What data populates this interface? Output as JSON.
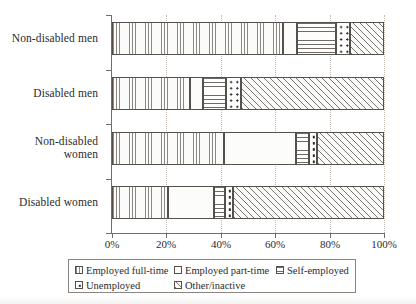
{
  "chart_data": {
    "type": "bar",
    "orientation": "horizontal",
    "stacked": true,
    "stacked_mode": "percent",
    "title": "",
    "xlabel": "",
    "ylabel": "",
    "xlim": [
      0,
      100
    ],
    "grid": true,
    "grid_axis": "x",
    "legend_position": "bottom",
    "categories": [
      "Non-disabled men",
      "Disabled men",
      "Non-disabled women",
      "Disabled women"
    ],
    "category_labels_wrapped": [
      "Non-disabled men",
      "Disabled men",
      "Non-disabled\nwomen",
      "Disabled women"
    ],
    "xticks": [
      0,
      20,
      40,
      60,
      80,
      100
    ],
    "xticklabels": [
      "0%",
      "20%",
      "40%",
      "60%",
      "80%",
      "100%"
    ],
    "series": [
      {
        "name": "Employed full-time",
        "pattern": "fine-vertical-lines",
        "values": [
          63,
          28.5,
          41,
          20.5
        ]
      },
      {
        "name": "Employed part-time",
        "pattern": "dense-dots",
        "values": [
          5,
          5,
          26.5,
          17
        ]
      },
      {
        "name": "Self-employed",
        "pattern": "horizontal-lines",
        "values": [
          14.5,
          8.5,
          5,
          4
        ]
      },
      {
        "name": "Unemployed",
        "pattern": "sparse-dots",
        "values": [
          5,
          5.5,
          3,
          3
        ]
      },
      {
        "name": "Other/inactive",
        "pattern": "diagonal-hatch",
        "values": [
          12.5,
          52.5,
          24.5,
          55.5
        ]
      }
    ]
  },
  "legend": {
    "items": [
      {
        "label": "Employed full-time",
        "pattern": "fine-vertical-lines",
        "row": 1,
        "col": 1
      },
      {
        "label": "Employed part-time",
        "pattern": "dense-dots",
        "row": 1,
        "col": 2
      },
      {
        "label": "Self-employed",
        "pattern": "horizontal-lines",
        "row": 1,
        "col": 3
      },
      {
        "label": "Unemployed",
        "pattern": "sparse-dots",
        "row": 2,
        "col": 1
      },
      {
        "label": "Other/inactive",
        "pattern": "diagonal-hatch",
        "row": 2,
        "col": 2
      }
    ]
  },
  "colors": {
    "ink": "#2b2b2b",
    "axis": "#6e6e6e",
    "grid": "#c2b9b2",
    "bar_outline": "#54504c",
    "background": "#ffffff"
  }
}
